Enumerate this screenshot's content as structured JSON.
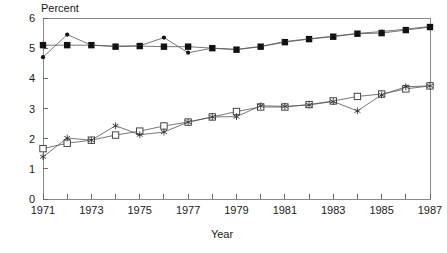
{
  "chart_data": {
    "type": "line",
    "title": "",
    "xlabel": "Year",
    "ylabel": "Percent",
    "ylabel_position": "top-left-horizontal",
    "xlim": [
      1971,
      1987
    ],
    "ylim": [
      0,
      6
    ],
    "grid": false,
    "legend": "none",
    "y_ticks": [
      0,
      1,
      2,
      3,
      4,
      5,
      6
    ],
    "y_tick_labels": [
      "0",
      "1",
      "2",
      "3",
      "4",
      "5",
      "6"
    ],
    "x": [
      1971,
      1972,
      1973,
      1974,
      1975,
      1976,
      1977,
      1978,
      1979,
      1980,
      1981,
      1982,
      1983,
      1984,
      1985,
      1986,
      1987
    ],
    "x_ticks": [
      1971,
      1972,
      1973,
      1974,
      1975,
      1976,
      1977,
      1978,
      1979,
      1980,
      1981,
      1982,
      1983,
      1984,
      1985,
      1986,
      1987
    ],
    "x_tick_labels": [
      "1971",
      "",
      "1973",
      "",
      "1975",
      "",
      "1977",
      "",
      "1979",
      "",
      "1981",
      "",
      "1983",
      "",
      "1985",
      "",
      "1987"
    ],
    "series": [
      {
        "name": "upper-filled-square",
        "marker": "filled-square",
        "color": "#111111",
        "values": [
          5.1,
          5.1,
          5.1,
          5.05,
          5.07,
          5.05,
          5.05,
          5.0,
          4.95,
          5.05,
          5.2,
          5.3,
          5.38,
          5.48,
          5.5,
          5.6,
          5.7
        ]
      },
      {
        "name": "upper-dot",
        "marker": "small-filled-circle",
        "color": "#111111",
        "values": [
          4.7,
          5.45,
          5.1,
          5.07,
          5.08,
          5.35,
          4.85,
          5.0,
          4.96,
          5.06,
          5.22,
          5.31,
          5.4,
          5.49,
          5.55,
          5.63,
          5.72
        ]
      },
      {
        "name": "lower-open-square",
        "marker": "open-square",
        "color": "#333333",
        "values": [
          1.67,
          1.85,
          1.95,
          2.12,
          2.25,
          2.42,
          2.55,
          2.72,
          2.9,
          3.05,
          3.05,
          3.13,
          3.25,
          3.4,
          3.48,
          3.65,
          3.75
        ]
      },
      {
        "name": "lower-star",
        "marker": "star",
        "color": "#333333",
        "values": [
          1.4,
          2.02,
          1.95,
          2.43,
          2.13,
          2.22,
          2.55,
          2.72,
          2.73,
          3.09,
          3.07,
          3.12,
          3.23,
          2.92,
          3.45,
          3.72,
          3.75
        ]
      }
    ]
  },
  "labels": {
    "ylabel": "Percent",
    "xlabel": "Year"
  }
}
